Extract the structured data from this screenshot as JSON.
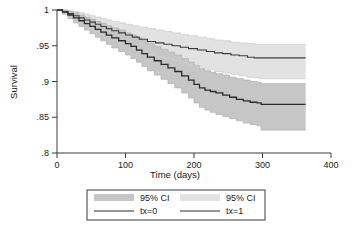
{
  "chart_data": {
    "type": "line",
    "title": "",
    "subtitle": "",
    "xlabel": "Time (days)",
    "ylabel": "Survival",
    "xlim": [
      0,
      400
    ],
    "ylim": [
      0.8,
      1.0
    ],
    "xticks": [
      0,
      100,
      200,
      300,
      400
    ],
    "xticklabels": [
      "0",
      "100",
      "200",
      "300",
      "400"
    ],
    "yticks": [
      0.8,
      0.85,
      0.9,
      0.95,
      1.0
    ],
    "yticklabels": [
      ".8",
      ".85",
      ".9",
      ".95",
      "1"
    ],
    "grid": false,
    "legend_position": "below-plot",
    "plot_kind": "kaplan-meier-step-with-confidence-bands",
    "data_end_day": 363,
    "series": [
      {
        "name": "tx=1",
        "role": "survival-curve-upper",
        "color": "#3d3d3d",
        "line_width": 1.1,
        "x": [
          0,
          8,
          16,
          24,
          32,
          40,
          48,
          56,
          64,
          72,
          80,
          90,
          100,
          110,
          120,
          132,
          144,
          156,
          168,
          180,
          192,
          205,
          218,
          230,
          242,
          254,
          266,
          278,
          288,
          296,
          305,
          320,
          340,
          363
        ],
        "y": [
          1.0,
          0.998,
          0.995,
          0.992,
          0.989,
          0.986,
          0.983,
          0.98,
          0.977,
          0.974,
          0.971,
          0.968,
          0.965,
          0.962,
          0.959,
          0.956,
          0.954,
          0.952,
          0.95,
          0.948,
          0.946,
          0.944,
          0.942,
          0.94,
          0.939,
          0.937,
          0.936,
          0.934,
          0.933,
          0.933,
          0.933,
          0.933,
          0.933,
          0.933
        ]
      },
      {
        "name": "tx=1 95% CI upper",
        "role": "confidence-upper",
        "color": "#dcdcdc",
        "x": [
          0,
          8,
          16,
          24,
          32,
          40,
          48,
          56,
          64,
          72,
          80,
          90,
          100,
          110,
          120,
          132,
          144,
          156,
          168,
          180,
          192,
          205,
          218,
          230,
          242,
          254,
          266,
          278,
          288,
          296,
          305,
          320,
          340,
          363
        ],
        "y": [
          1.0,
          1.0,
          0.999,
          0.998,
          0.996,
          0.994,
          0.992,
          0.99,
          0.988,
          0.986,
          0.984,
          0.982,
          0.98,
          0.978,
          0.976,
          0.974,
          0.972,
          0.97,
          0.968,
          0.966,
          0.964,
          0.962,
          0.96,
          0.958,
          0.957,
          0.955,
          0.954,
          0.953,
          0.952,
          0.952,
          0.952,
          0.952,
          0.952,
          0.952
        ]
      },
      {
        "name": "tx=1 95% CI lower",
        "role": "confidence-lower",
        "color": "#dcdcdc",
        "x": [
          0,
          8,
          16,
          24,
          32,
          40,
          48,
          56,
          64,
          72,
          80,
          90,
          100,
          110,
          120,
          132,
          144,
          156,
          168,
          180,
          192,
          205,
          218,
          230,
          242,
          254,
          266,
          278,
          288,
          296,
          305,
          320,
          340,
          363
        ],
        "y": [
          1.0,
          0.996,
          0.991,
          0.986,
          0.982,
          0.978,
          0.974,
          0.97,
          0.966,
          0.962,
          0.958,
          0.954,
          0.95,
          0.946,
          0.942,
          0.938,
          0.935,
          0.932,
          0.929,
          0.926,
          0.923,
          0.92,
          0.917,
          0.914,
          0.912,
          0.91,
          0.908,
          0.906,
          0.905,
          0.904,
          0.904,
          0.904,
          0.904,
          0.904
        ]
      },
      {
        "name": "tx=0",
        "role": "survival-curve-lower",
        "color": "#2b2b2b",
        "line_width": 1.3,
        "x": [
          0,
          8,
          16,
          24,
          32,
          40,
          48,
          56,
          64,
          72,
          80,
          90,
          100,
          108,
          116,
          124,
          132,
          142,
          152,
          162,
          172,
          182,
          192,
          200,
          208,
          216,
          224,
          232,
          242,
          252,
          262,
          272,
          282,
          292,
          298,
          310,
          330,
          363
        ],
        "y": [
          1.0,
          0.997,
          0.993,
          0.989,
          0.985,
          0.981,
          0.977,
          0.973,
          0.969,
          0.965,
          0.961,
          0.957,
          0.953,
          0.949,
          0.944,
          0.939,
          0.934,
          0.929,
          0.924,
          0.919,
          0.914,
          0.908,
          0.902,
          0.896,
          0.891,
          0.888,
          0.886,
          0.884,
          0.881,
          0.878,
          0.875,
          0.873,
          0.871,
          0.87,
          0.868,
          0.868,
          0.868,
          0.868
        ]
      },
      {
        "name": "tx=0 95% CI upper",
        "role": "confidence-upper",
        "color": "#c6c6c6",
        "x": [
          0,
          8,
          16,
          24,
          32,
          40,
          48,
          56,
          64,
          72,
          80,
          90,
          100,
          108,
          116,
          124,
          132,
          142,
          152,
          162,
          172,
          182,
          192,
          200,
          208,
          216,
          224,
          232,
          242,
          252,
          262,
          272,
          282,
          292,
          298,
          310,
          330,
          363
        ],
        "y": [
          1.0,
          1.0,
          0.998,
          0.996,
          0.993,
          0.99,
          0.987,
          0.984,
          0.981,
          0.978,
          0.975,
          0.972,
          0.968,
          0.965,
          0.961,
          0.957,
          0.953,
          0.949,
          0.945,
          0.941,
          0.937,
          0.932,
          0.927,
          0.922,
          0.918,
          0.915,
          0.913,
          0.911,
          0.909,
          0.906,
          0.904,
          0.902,
          0.9,
          0.899,
          0.897,
          0.897,
          0.897,
          0.897
        ]
      },
      {
        "name": "tx=0 95% CI lower",
        "role": "confidence-lower",
        "color": "#c6c6c6",
        "x": [
          0,
          8,
          16,
          24,
          32,
          40,
          48,
          56,
          64,
          72,
          80,
          90,
          100,
          108,
          116,
          124,
          132,
          142,
          152,
          162,
          172,
          182,
          192,
          200,
          208,
          216,
          224,
          232,
          242,
          252,
          262,
          272,
          282,
          292,
          298,
          310,
          330,
          363
        ],
        "y": [
          1.0,
          0.994,
          0.988,
          0.982,
          0.977,
          0.972,
          0.967,
          0.962,
          0.957,
          0.952,
          0.947,
          0.942,
          0.937,
          0.932,
          0.927,
          0.921,
          0.915,
          0.909,
          0.903,
          0.897,
          0.891,
          0.884,
          0.877,
          0.87,
          0.864,
          0.86,
          0.857,
          0.854,
          0.851,
          0.848,
          0.845,
          0.842,
          0.84,
          0.838,
          0.832,
          0.832,
          0.832,
          0.832
        ]
      }
    ],
    "legend": [
      {
        "label": "95% CI",
        "kind": "swatch",
        "color": "#c6c6c6"
      },
      {
        "label": "95% CI",
        "kind": "swatch",
        "color": "#e2e2e2"
      },
      {
        "label": "tx=0",
        "kind": "line",
        "color": "#2b2b2b"
      },
      {
        "label": "tx=1",
        "kind": "line",
        "color": "#3d3d3d"
      }
    ]
  },
  "colors": {
    "axis": "#3a3a3a",
    "text": "#1a1a1a",
    "background": "#ffffff",
    "ci_tx0": "#c6c6c6",
    "ci_tx1": "#e2e2e2",
    "line_tx0": "#2b2b2b",
    "line_tx1": "#3d3d3d"
  }
}
